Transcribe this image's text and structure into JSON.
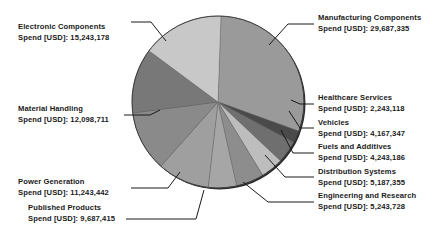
{
  "chart_data": {
    "type": "pie",
    "title": "",
    "subtitle": "",
    "xlabel": "",
    "ylabel": "",
    "value_prefix": "Spend [USD]: ",
    "legend_position": "callout-labels",
    "grid": false,
    "categories": [
      "Manufacturing Components",
      "Healthcare Services",
      "Vehicles",
      "Fuels and Additives",
      "Distribution Systems",
      "Engineering and Research",
      "Published Products",
      "Power Generation",
      "Material Handling",
      "Electronic Components"
    ],
    "values": [
      29687335,
      2243118,
      4167347,
      4243186,
      5187355,
      5243728,
      9687415,
      11243442,
      12098711,
      15243178
    ],
    "value_labels": [
      "29,687,335",
      "2,243,118",
      "4,167,347",
      "4,243,186",
      "5,187,355",
      "5,243,728",
      "9,687,415",
      "11,243,442",
      "12,098,711",
      "15,243,178"
    ],
    "colors": [
      "#9a9a9a",
      "#4a4a4a",
      "#6f6f6f",
      "#bdbdbd",
      "#8d8d8d",
      "#a6a6a6",
      "#9f9f9f",
      "#8a8a8a",
      "#787878",
      "#c8c8c8"
    ],
    "total": 99043815
  },
  "labels": [
    {
      "name": "Electronic Components",
      "value": "Spend [USD]: 15,243,178"
    },
    {
      "name": "Material Handling",
      "value": "Spend [USD]: 12,098,711"
    },
    {
      "name": "Power Generation",
      "value": "Spend [USD]: 11,243,442"
    },
    {
      "name": "Published Products",
      "value": "Spend [USD]: 9,687,415"
    },
    {
      "name": "Manufacturing Components",
      "value": "Spend [USD]: 29,687,335"
    },
    {
      "name": "Healthcare Services",
      "value": "Spend [USD]: 2,243,118"
    },
    {
      "name": "Vehicles",
      "value": "Spend [USD]: 4,167,347"
    },
    {
      "name": "Fuels and Additives",
      "value": "Spend [USD]: 4,243,186"
    },
    {
      "name": "Distribution Systems",
      "value": "Spend [USD]: 5,187,355"
    },
    {
      "name": "Engineering and Research",
      "value": "Spend [USD]: 5,243,728"
    }
  ]
}
